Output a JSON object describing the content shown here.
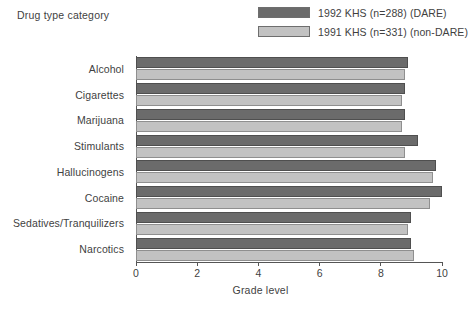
{
  "figure": {
    "y_axis_title": "Drug type category",
    "x_axis_title": "Grade level"
  },
  "legend": {
    "position": "top-right",
    "entries": [
      {
        "label": "1992 KHS (n=288) (DARE)",
        "color": "#6b6b6b",
        "swatch": "dark-swatch"
      },
      {
        "label": "1991 KHS (n=331) (non-DARE)",
        "color": "#c2c2c2",
        "swatch": "light-swatch"
      }
    ]
  },
  "x_ticks": [
    {
      "label": "0",
      "value": 0
    },
    {
      "label": "2",
      "value": 2
    },
    {
      "label": "4",
      "value": 4
    },
    {
      "label": "6",
      "value": 6
    },
    {
      "label": "8",
      "value": 8
    },
    {
      "label": "10",
      "value": 10
    }
  ],
  "categories": [
    "Alcohol",
    "Cigarettes",
    "Marijuana",
    "Stimulants",
    "Hallucinogens",
    "Cocaine",
    "Sedatives/Tranquilizers",
    "Narcotics"
  ],
  "chart_data": {
    "type": "bar",
    "orientation": "horizontal",
    "title": "",
    "subtitle": "",
    "xlabel": "Grade level",
    "ylabel": "Drug type category",
    "xlim": [
      0,
      10
    ],
    "xticks": [
      0,
      2,
      4,
      6,
      8,
      10
    ],
    "grid": false,
    "legend_position": "top-right",
    "categories": [
      "Alcohol",
      "Cigarettes",
      "Marijuana",
      "Stimulants",
      "Hallucinogens",
      "Cocaine",
      "Sedatives/Tranquilizers",
      "Narcotics"
    ],
    "series": [
      {
        "name": "1992 KHS (n=288) (DARE)",
        "color": "#6b6b6b",
        "values": [
          8.9,
          8.8,
          8.8,
          9.2,
          9.8,
          10.0,
          9.0,
          9.0
        ]
      },
      {
        "name": "1991 KHS (n=331) (non-DARE)",
        "color": "#c2c2c2",
        "values": [
          8.8,
          8.7,
          8.7,
          8.8,
          9.7,
          9.6,
          8.9,
          9.1
        ]
      }
    ]
  }
}
